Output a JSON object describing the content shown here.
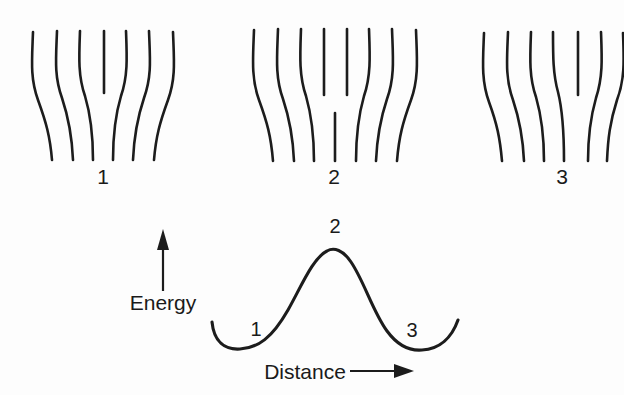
{
  "figure": {
    "type": "diagram",
    "background_color": "#fdfdfd",
    "line_color": "#1c1c1c"
  },
  "lattice_panels": [
    {
      "label": "1",
      "label_x": 103,
      "label_y": 184,
      "state": "dislocation-at-initial-position",
      "top_line_count": 7,
      "bottom_line_count": 6,
      "lines": [
        {
          "name": "line-1",
          "d": "M 33 32 C 32 60, 30 78, 38 100 C 46 122, 50 136, 52 160"
        },
        {
          "name": "line-2",
          "d": "M 57 31 C 56 58, 54 76, 62 98 C 69 119, 72 136, 73 160"
        },
        {
          "name": "line-3",
          "d": "M 80 31 C 79 57, 78 76, 85 96 C 91 116, 93 138, 93 160"
        },
        {
          "name": "line-4-terminating",
          "d": "M 104 31 C 104 55, 104 72, 104 93"
        },
        {
          "name": "line-5",
          "d": "M 126 31 C 127 57, 128 76, 121 96 C 115 116, 113 138, 113 160"
        },
        {
          "name": "line-6",
          "d": "M 149 31 C 150 58, 152 76, 144 98 C 137 119, 134 136, 133 160"
        },
        {
          "name": "line-7",
          "d": "M 173 32 C 174 60, 176 78, 168 100 C 160 122, 156 136, 154 160"
        }
      ]
    },
    {
      "label": "2",
      "label_x": 334,
      "label_y": 184,
      "state": "saddle-point-configuration",
      "top_line_count": 8,
      "bottom_line_count": 7,
      "lines": [
        {
          "name": "line-1",
          "d": "M 254 30 C 253 58, 251 78, 259 100 C 267 122, 271 136, 273 161"
        },
        {
          "name": "line-2",
          "d": "M 278 29 C 277 57, 275 77, 283 99 C 290 120, 293 137, 294 161"
        },
        {
          "name": "line-3",
          "d": "M 301 29 C 300 56, 299 76, 306 96 C 312 117, 314 139, 314 161"
        },
        {
          "name": "line-4-terminating-upper",
          "d": "M 324 29 C 324 52, 324 70, 324 95"
        },
        {
          "name": "line-5-terminating-upper",
          "d": "M 347 29 C 347 52, 347 70, 347 95"
        },
        {
          "name": "line-6-stub-lower",
          "d": "M 335 113 L 335 161"
        },
        {
          "name": "line-7",
          "d": "M 369 29 C 370 56, 371 76, 364 96 C 358 117, 356 139, 356 161"
        },
        {
          "name": "line-8",
          "d": "M 392 29 C 393 57, 395 77, 387 99 C 380 120, 377 137, 376 161"
        },
        {
          "name": "line-9",
          "d": "M 416 30 C 417 58, 419 78, 411 100 C 403 122, 399 136, 397 161"
        }
      ]
    },
    {
      "label": "3",
      "label_x": 562,
      "label_y": 184,
      "state": "dislocation-shifted-to-next-position",
      "top_line_count": 7,
      "bottom_line_count": 6,
      "lines": [
        {
          "name": "line-1",
          "d": "M 484 33 C 483 60, 481 80, 489 102 C 497 124, 500 138, 502 161"
        },
        {
          "name": "line-2",
          "d": "M 508 32 C 507 59, 505 78, 513 100 C 520 121, 523 138, 524 161"
        },
        {
          "name": "line-3",
          "d": "M 531 32 C 530 58, 529 77, 536 97 C 542 118, 544 140, 544 161"
        },
        {
          "name": "line-4",
          "d": "M 553 32 C 553 56, 553 74, 558 92 C 563 112, 564 140, 564 161"
        },
        {
          "name": "line-5-terminating",
          "d": "M 578 32 C 578 56, 578 74, 578 95"
        },
        {
          "name": "line-6",
          "d": "M 601 32 C 602 58, 603 77, 596 98 C 590 119, 588 138, 588 161"
        },
        {
          "name": "line-7",
          "d": "M 623 33 C 624 60, 625 79, 617 100 C 610 122, 608 138, 607 161"
        }
      ]
    }
  ],
  "energy_plot": {
    "curve_path": "M 212 322 C 214 342, 225 350, 240 349 C 258 348, 272 338, 288 310 C 302 285, 313 258, 327 251 C 334 247, 343 250, 351 262 C 364 281, 373 312, 387 331 C 398 346, 410 351, 422 350 C 440 349, 452 337, 458 320",
    "y_axis_arrow": {
      "name": "energy-axis-arrow",
      "line_d": "M 163 291 L 163 243",
      "head_points": "163,229 157,250 169,250"
    },
    "x_axis_arrow": {
      "name": "distance-axis-arrow",
      "line_d": "M 350 371 L 398 371",
      "head_points": "414,371 394,364 394,378"
    },
    "y_axis_label": "Energy",
    "y_axis_label_x": 163,
    "y_axis_label_y": 310,
    "x_axis_label": "Distance",
    "x_axis_label_x": 305,
    "x_axis_label_y": 379,
    "markers": [
      {
        "name": "energy-marker-1",
        "label": "1",
        "x": 256,
        "y": 336,
        "meaning": "energy-minimum-initial"
      },
      {
        "name": "energy-marker-2",
        "label": "2",
        "x": 335,
        "y": 233,
        "meaning": "energy-maximum-saddle"
      },
      {
        "name": "energy-marker-3",
        "label": "3",
        "x": 412,
        "y": 337,
        "meaning": "energy-minimum-final"
      }
    ]
  },
  "chart_data": {
    "type": "line",
    "title": "",
    "xlabel": "Distance",
    "ylabel": "Energy",
    "grid": false,
    "legend": false,
    "annotations": [
      "1",
      "2",
      "3"
    ],
    "x": [
      0,
      10,
      20,
      30,
      40,
      50,
      60,
      70,
      80,
      90,
      100
    ],
    "values": [
      22,
      6,
      3,
      14,
      46,
      78,
      46,
      14,
      3,
      6,
      22
    ],
    "xlim": [
      0,
      100
    ],
    "ylim": [
      0,
      100
    ]
  }
}
